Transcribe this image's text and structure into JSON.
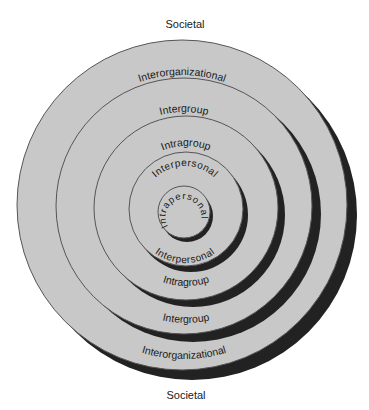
{
  "diagram": {
    "title_top": "Societal",
    "title_bottom": "Societal",
    "colors": {
      "background": "#ffffff",
      "fill": "#c8c8c8",
      "outline": "#555555",
      "shadow": "#222222",
      "text": "#1a1a1a"
    },
    "levels": [
      {
        "name": "Interorganizational",
        "top_label": "Interorganizational",
        "bottom_label": "Interorganizational"
      },
      {
        "name": "Intergroup",
        "top_label": "Intergroup",
        "bottom_label": "Intergroup"
      },
      {
        "name": "Intragroup",
        "top_label": "Intragroup",
        "bottom_label": "Intragroup"
      },
      {
        "name": "Interpersonal",
        "top_label": "Interpersonal",
        "bottom_label": "Interpersonal"
      },
      {
        "name": "Intrapersonal",
        "center_label": "Intrapersonal"
      }
    ]
  }
}
